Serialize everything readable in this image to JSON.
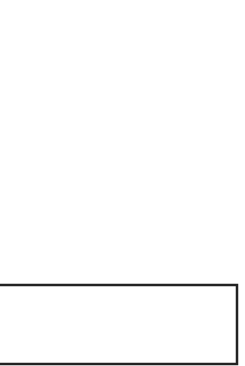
{
  "diagram": {
    "label_fragment": "s",
    "poles": [
      {
        "name": "pole-left"
      },
      {
        "name": "pole-middle"
      },
      {
        "name": "pole-right"
      }
    ],
    "stroke_color": "#222222",
    "fill_color": "#ffffff"
  }
}
